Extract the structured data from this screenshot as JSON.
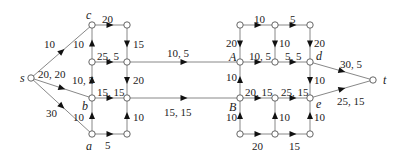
{
  "diagram": {
    "type": "flow-network",
    "nodes": [
      {
        "id": "s",
        "label": "s",
        "x": 31,
        "y": 78,
        "lx": 20,
        "ly": 82
      },
      {
        "id": "c",
        "label": "c",
        "x": 92,
        "y": 25,
        "lx": 86,
        "ly": 19
      },
      {
        "id": "n2",
        "label": "",
        "x": 92,
        "y": 62
      },
      {
        "id": "b",
        "label": "b",
        "x": 92,
        "y": 98,
        "lx": 82,
        "ly": 110
      },
      {
        "id": "a",
        "label": "a",
        "x": 92,
        "y": 134,
        "lx": 86,
        "ly": 150
      },
      {
        "id": "m1",
        "label": "",
        "x": 127,
        "y": 25
      },
      {
        "id": "m2",
        "label": "",
        "x": 127,
        "y": 62
      },
      {
        "id": "m3",
        "label": "",
        "x": 127,
        "y": 98
      },
      {
        "id": "m4",
        "label": "",
        "x": 127,
        "y": 134
      },
      {
        "id": "r1",
        "label": "",
        "x": 240,
        "y": 25
      },
      {
        "id": "A",
        "label": "A",
        "x": 240,
        "y": 62,
        "lx": 229,
        "ly": 61
      },
      {
        "id": "B",
        "label": "B",
        "x": 240,
        "y": 98,
        "lx": 229,
        "ly": 111
      },
      {
        "id": "r4",
        "label": "",
        "x": 240,
        "y": 134
      },
      {
        "id": "r5",
        "label": "",
        "x": 275,
        "y": 25
      },
      {
        "id": "r6",
        "label": "",
        "x": 275,
        "y": 62
      },
      {
        "id": "r7",
        "label": "",
        "x": 275,
        "y": 98
      },
      {
        "id": "r8",
        "label": "",
        "x": 275,
        "y": 134
      },
      {
        "id": "r9",
        "label": "",
        "x": 310,
        "y": 25
      },
      {
        "id": "d",
        "label": "d",
        "x": 310,
        "y": 62,
        "lx": 316,
        "ly": 60
      },
      {
        "id": "e",
        "label": "e",
        "x": 310,
        "y": 98,
        "lx": 316,
        "ly": 108
      },
      {
        "id": "r12",
        "label": "",
        "x": 310,
        "y": 134
      },
      {
        "id": "t",
        "label": "t",
        "x": 373,
        "y": 80,
        "lx": 383,
        "ly": 84
      }
    ],
    "edges": [
      {
        "from": "s",
        "to": "c",
        "label": "10",
        "lx": 44,
        "ly": 48
      },
      {
        "from": "s",
        "to": "b",
        "label": "20, 20",
        "lx": 38,
        "ly": 78
      },
      {
        "from": "s",
        "to": "a",
        "label": "30",
        "lx": 46,
        "ly": 117
      },
      {
        "from": "c",
        "to": "m1",
        "label": "20",
        "lx": 102,
        "ly": 23
      },
      {
        "from": "n2",
        "to": "c",
        "label": "10",
        "lx": 73,
        "ly": 48
      },
      {
        "from": "n2",
        "to": "m2",
        "label": "25, 5",
        "lx": 97,
        "ly": 60
      },
      {
        "from": "b",
        "to": "n2",
        "label": "10, 5",
        "lx": 72,
        "ly": 84
      },
      {
        "from": "b",
        "to": "m3",
        "label": "15, 15",
        "lx": 97,
        "ly": 96
      },
      {
        "from": "a",
        "to": "b",
        "label": "10",
        "lx": 73,
        "ly": 121
      },
      {
        "from": "a",
        "to": "m4",
        "label": "5",
        "lx": 105,
        "ly": 149
      },
      {
        "from": "m1",
        "to": "m2",
        "label": "15",
        "lx": 133,
        "ly": 48
      },
      {
        "from": "m2",
        "to": "m3",
        "label": "20",
        "lx": 133,
        "ly": 84
      },
      {
        "from": "m4",
        "to": "m3",
        "label": "10",
        "lx": 133,
        "ly": 121
      },
      {
        "from": "m2",
        "to": "A",
        "label": "10, 5",
        "lx": 167,
        "ly": 57
      },
      {
        "from": "m3",
        "to": "B",
        "label": "15, 15",
        "lx": 164,
        "ly": 116
      },
      {
        "from": "r1",
        "to": "A",
        "label": "20",
        "lx": 226,
        "ly": 47
      },
      {
        "from": "B",
        "to": "A",
        "label": "10",
        "lx": 226,
        "ly": 81
      },
      {
        "from": "r4",
        "to": "B",
        "label": "10",
        "lx": 226,
        "ly": 121
      },
      {
        "from": "r1",
        "to": "r5",
        "label": "10",
        "lx": 254,
        "ly": 23
      },
      {
        "from": "r5",
        "to": "r9",
        "label": "5",
        "lx": 290,
        "ly": 23
      },
      {
        "from": "A",
        "to": "r6",
        "label": "10, 5",
        "lx": 249,
        "ly": 60
      },
      {
        "from": "r6",
        "to": "d",
        "label": "5, 5",
        "lx": 285,
        "ly": 60
      },
      {
        "from": "B",
        "to": "r7",
        "label": "20, 15",
        "lx": 245,
        "ly": 96
      },
      {
        "from": "r7",
        "to": "e",
        "label": "25, 15",
        "lx": 281,
        "ly": 96
      },
      {
        "from": "r4",
        "to": "r8",
        "label": "20",
        "lx": 252,
        "ly": 150
      },
      {
        "from": "r8",
        "to": "r12",
        "label": "15",
        "lx": 289,
        "ly": 150
      },
      {
        "from": "r5",
        "to": "r6",
        "label": "10",
        "lx": 279,
        "ly": 47
      },
      {
        "from": "r8",
        "to": "r7",
        "label": "10",
        "lx": 279,
        "ly": 121
      },
      {
        "from": "r9",
        "to": "d",
        "label": "20",
        "lx": 314,
        "ly": 47
      },
      {
        "from": "d",
        "to": "e",
        "label": "10",
        "lx": 314,
        "ly": 84
      },
      {
        "from": "r12",
        "to": "e",
        "label": "10",
        "lx": 314,
        "ly": 121
      },
      {
        "from": "d",
        "to": "t",
        "label": "30, 5",
        "lx": 340,
        "ly": 68
      },
      {
        "from": "e",
        "to": "t",
        "label": "25, 15",
        "lx": 337,
        "ly": 105
      }
    ]
  }
}
